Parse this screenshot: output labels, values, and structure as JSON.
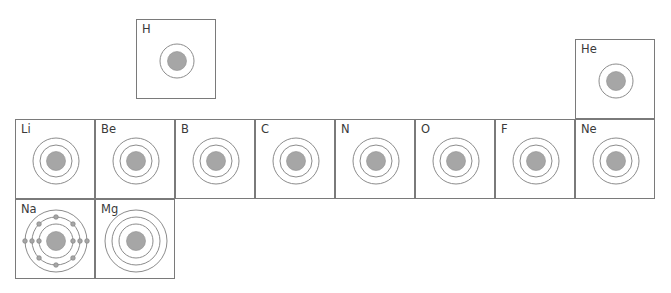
{
  "diagram": {
    "title": "",
    "colors": {
      "border": "#7a7a7a",
      "shell": "#8c8c8c",
      "nucleus": "#a6a6a6",
      "electron": "#a6a6a6",
      "text": "#3a3a3a"
    },
    "elements": [
      {
        "symbol": "H",
        "row": 1,
        "col": 2,
        "shells": 1,
        "electrons": []
      },
      {
        "symbol": "He",
        "row": 1,
        "col": 8,
        "shells": 1,
        "electrons": []
      },
      {
        "symbol": "Li",
        "row": 2,
        "col": 1,
        "shells": 2,
        "electrons": []
      },
      {
        "symbol": "Be",
        "row": 2,
        "col": 2,
        "shells": 2,
        "electrons": []
      },
      {
        "symbol": "B",
        "row": 2,
        "col": 3,
        "shells": 2,
        "electrons": []
      },
      {
        "symbol": "C",
        "row": 2,
        "col": 4,
        "shells": 2,
        "electrons": []
      },
      {
        "symbol": "N",
        "row": 2,
        "col": 5,
        "shells": 2,
        "electrons": []
      },
      {
        "symbol": "O",
        "row": 2,
        "col": 6,
        "shells": 2,
        "electrons": []
      },
      {
        "symbol": "F",
        "row": 2,
        "col": 7,
        "shells": 2,
        "electrons": []
      },
      {
        "symbol": "Ne",
        "row": 2,
        "col": 8,
        "shells": 2,
        "electrons": []
      },
      {
        "symbol": "Na",
        "row": 3,
        "col": 1,
        "shells": 3,
        "electrons": [
          2,
          8,
          1
        ]
      },
      {
        "symbol": "Mg",
        "row": 3,
        "col": 2,
        "shells": 3,
        "electrons": []
      }
    ]
  }
}
